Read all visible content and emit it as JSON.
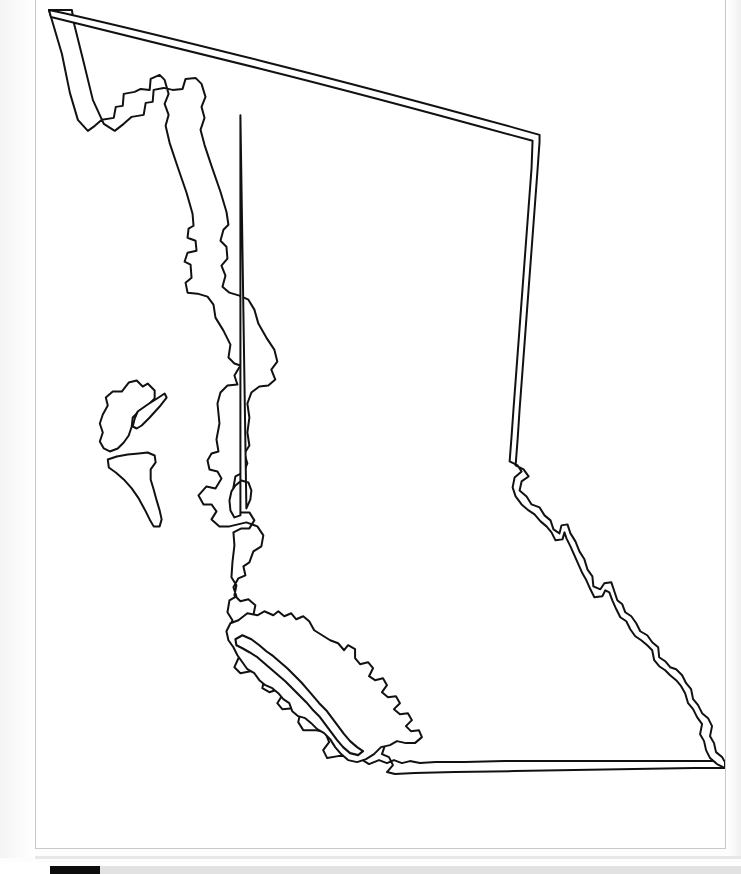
{
  "document": {
    "title": "Blank Outline Map",
    "page_background": "#ffffff",
    "border_color": "#c9c9c9",
    "viewer_background": "#fdfdfd"
  },
  "map": {
    "name": "British Columbia",
    "country": "Canada",
    "type": "blank-outline-map",
    "projection_note": "political outline, no labels",
    "stroke_color": "#111111",
    "fill_color": "#ffffff",
    "stroke_width_px": 2,
    "features": [
      {
        "id": "mainland",
        "name": "British Columbia mainland",
        "kind": "province-outline",
        "description": "Mainland province boundary: straight 60th-parallel northern border, panhandle-notched northwest Alaska boundary, indented Pacific coastline on the west, jagged Rocky Mountain boundary with Alberta on the east, and a straight 49th-parallel southern border with the United States."
      },
      {
        "id": "graham-island",
        "name": "Graham Island",
        "kind": "island",
        "group": "Haida Gwaii"
      },
      {
        "id": "moresby-island",
        "name": "Moresby Island",
        "kind": "island",
        "group": "Haida Gwaii"
      },
      {
        "id": "princess-royal-island",
        "name": "Princess Royal Island",
        "kind": "island",
        "group": "North Coast"
      },
      {
        "id": "vancouver-island",
        "name": "Vancouver Island",
        "kind": "island",
        "group": "South Coast"
      }
    ],
    "labels": [],
    "legend": []
  },
  "scrollbar": {
    "orientation": "horizontal",
    "track_color": "#e2e2e2",
    "thumb_color": "#0d0d0d",
    "thumb_position_percent": 0,
    "thumb_size_percent": 7
  }
}
